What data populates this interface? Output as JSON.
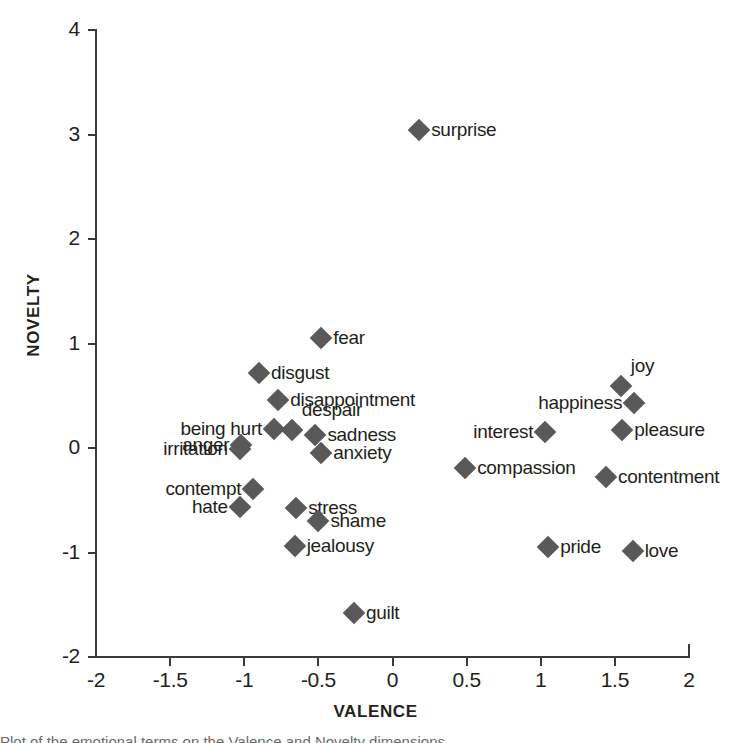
{
  "chart_data": {
    "type": "scatter",
    "title": "",
    "xlabel": "VALENCE",
    "ylabel": "NOVELTY",
    "xlim": [
      -2,
      2
    ],
    "ylim": [
      -2,
      4
    ],
    "xticks": [
      "-2",
      "-1.5",
      "-1",
      "-0.5",
      "0",
      "0.5",
      "1",
      "1.5",
      "2"
    ],
    "xtick_values": [
      -2,
      -1.5,
      -1,
      -0.5,
      0,
      0.5,
      1,
      1.5,
      2
    ],
    "yticks": [
      "4",
      "3",
      "2",
      "1",
      "0",
      "-1",
      "-2"
    ],
    "ytick_values": [
      4,
      3,
      2,
      1,
      0,
      -1,
      -2
    ],
    "grid": false,
    "legend": "none",
    "marker": "diamond",
    "marker_color": "#595959",
    "axis_color": "#3a3a3a",
    "points": [
      {
        "label": "surprise",
        "x": 0.18,
        "y": 3.04,
        "side": "right"
      },
      {
        "label": "fear",
        "x": -0.48,
        "y": 1.05,
        "side": "right"
      },
      {
        "label": "disgust",
        "x": -0.9,
        "y": 0.72,
        "side": "right"
      },
      {
        "label": "joy",
        "x": 1.54,
        "y": 0.59,
        "side": "above"
      },
      {
        "label": "disappointment",
        "x": -0.77,
        "y": 0.46,
        "side": "right"
      },
      {
        "label": "happiness",
        "x": 1.63,
        "y": 0.43,
        "side": "left"
      },
      {
        "label": "being hurt",
        "x": -0.8,
        "y": 0.18,
        "side": "left"
      },
      {
        "label": "despair",
        "x": -0.68,
        "y": 0.17,
        "side": "above"
      },
      {
        "label": "sadness",
        "x": -0.52,
        "y": 0.12,
        "side": "right"
      },
      {
        "label": "interest",
        "x": 1.03,
        "y": 0.15,
        "side": "left"
      },
      {
        "label": "pleasure",
        "x": 1.55,
        "y": 0.17,
        "side": "right"
      },
      {
        "label": "anger",
        "x": -1.02,
        "y": 0.03,
        "side": "left"
      },
      {
        "label": "irritation",
        "x": -1.03,
        "y": -0.01,
        "side": "left"
      },
      {
        "label": "anxiety",
        "x": -0.48,
        "y": -0.05,
        "side": "right"
      },
      {
        "label": "compassion",
        "x": 0.49,
        "y": -0.19,
        "side": "right"
      },
      {
        "label": "contentment",
        "x": 1.44,
        "y": -0.28,
        "side": "right"
      },
      {
        "label": "contempt",
        "x": -0.94,
        "y": -0.39,
        "side": "left"
      },
      {
        "label": "hate",
        "x": -1.03,
        "y": -0.56,
        "side": "left"
      },
      {
        "label": "stress",
        "x": -0.65,
        "y": -0.57,
        "side": "right"
      },
      {
        "label": "shame",
        "x": -0.5,
        "y": -0.7,
        "side": "right"
      },
      {
        "label": "jealousy",
        "x": -0.66,
        "y": -0.94,
        "side": "right"
      },
      {
        "label": "pride",
        "x": 1.05,
        "y": -0.95,
        "side": "right"
      },
      {
        "label": "love",
        "x": 1.62,
        "y": -0.99,
        "side": "right"
      },
      {
        "label": "guilt",
        "x": -0.26,
        "y": -1.58,
        "side": "right"
      }
    ]
  },
  "axes": {
    "x_title": "VALENCE",
    "y_title": "NOVELTY"
  },
  "caption": {
    "partial_text": "Plot of the emotional terms on the Valence and Novelty dimensions"
  }
}
